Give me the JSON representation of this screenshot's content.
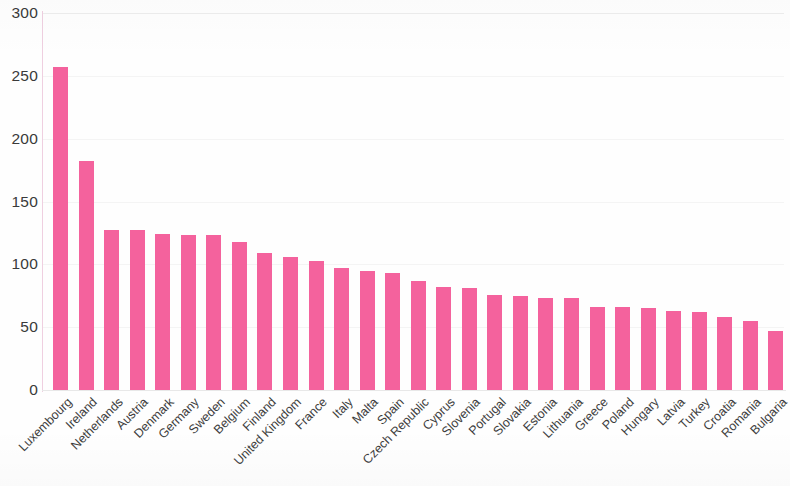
{
  "chart_data": {
    "type": "bar",
    "title": "",
    "subtitle": "",
    "xlabel": "",
    "ylabel": "",
    "ylim": [
      0,
      300
    ],
    "xlim_categories": 29,
    "grid": true,
    "grid_axis": "y",
    "legend": false,
    "legend_position": "none",
    "bar_color": "#F4629D",
    "background_color": "#FFFFFF",
    "axis_label_color": "#3A3A3A",
    "y_ticks": [
      0,
      50,
      100,
      150,
      200,
      250,
      300
    ],
    "y_tick_labels": [
      "0",
      "50",
      "100",
      "150",
      "200",
      "250",
      "300"
    ],
    "categories": [
      "Luxembourg",
      "Ireland",
      "Netherlands",
      "Austria",
      "Denmark",
      "Germany",
      "Sweden",
      "Belgium",
      "Finland",
      "United Kingdom",
      "France",
      "Italy",
      "Malta",
      "Spain",
      "Czech Republic",
      "Cyprus",
      "Slovenia",
      "Portugal",
      "Slovakia",
      "Estonia",
      "Lithuania",
      "Greece",
      "Poland",
      "Hungary",
      "Latvia",
      "Turkey",
      "Croatia",
      "Romania",
      "Bulgaria"
    ],
    "values": [
      257,
      182,
      127,
      127,
      124,
      123,
      123,
      118,
      109,
      106,
      103,
      97,
      95,
      93,
      87,
      82,
      81,
      76,
      75,
      73,
      73,
      66,
      66,
      65,
      63,
      62,
      58,
      55,
      47
    ]
  }
}
